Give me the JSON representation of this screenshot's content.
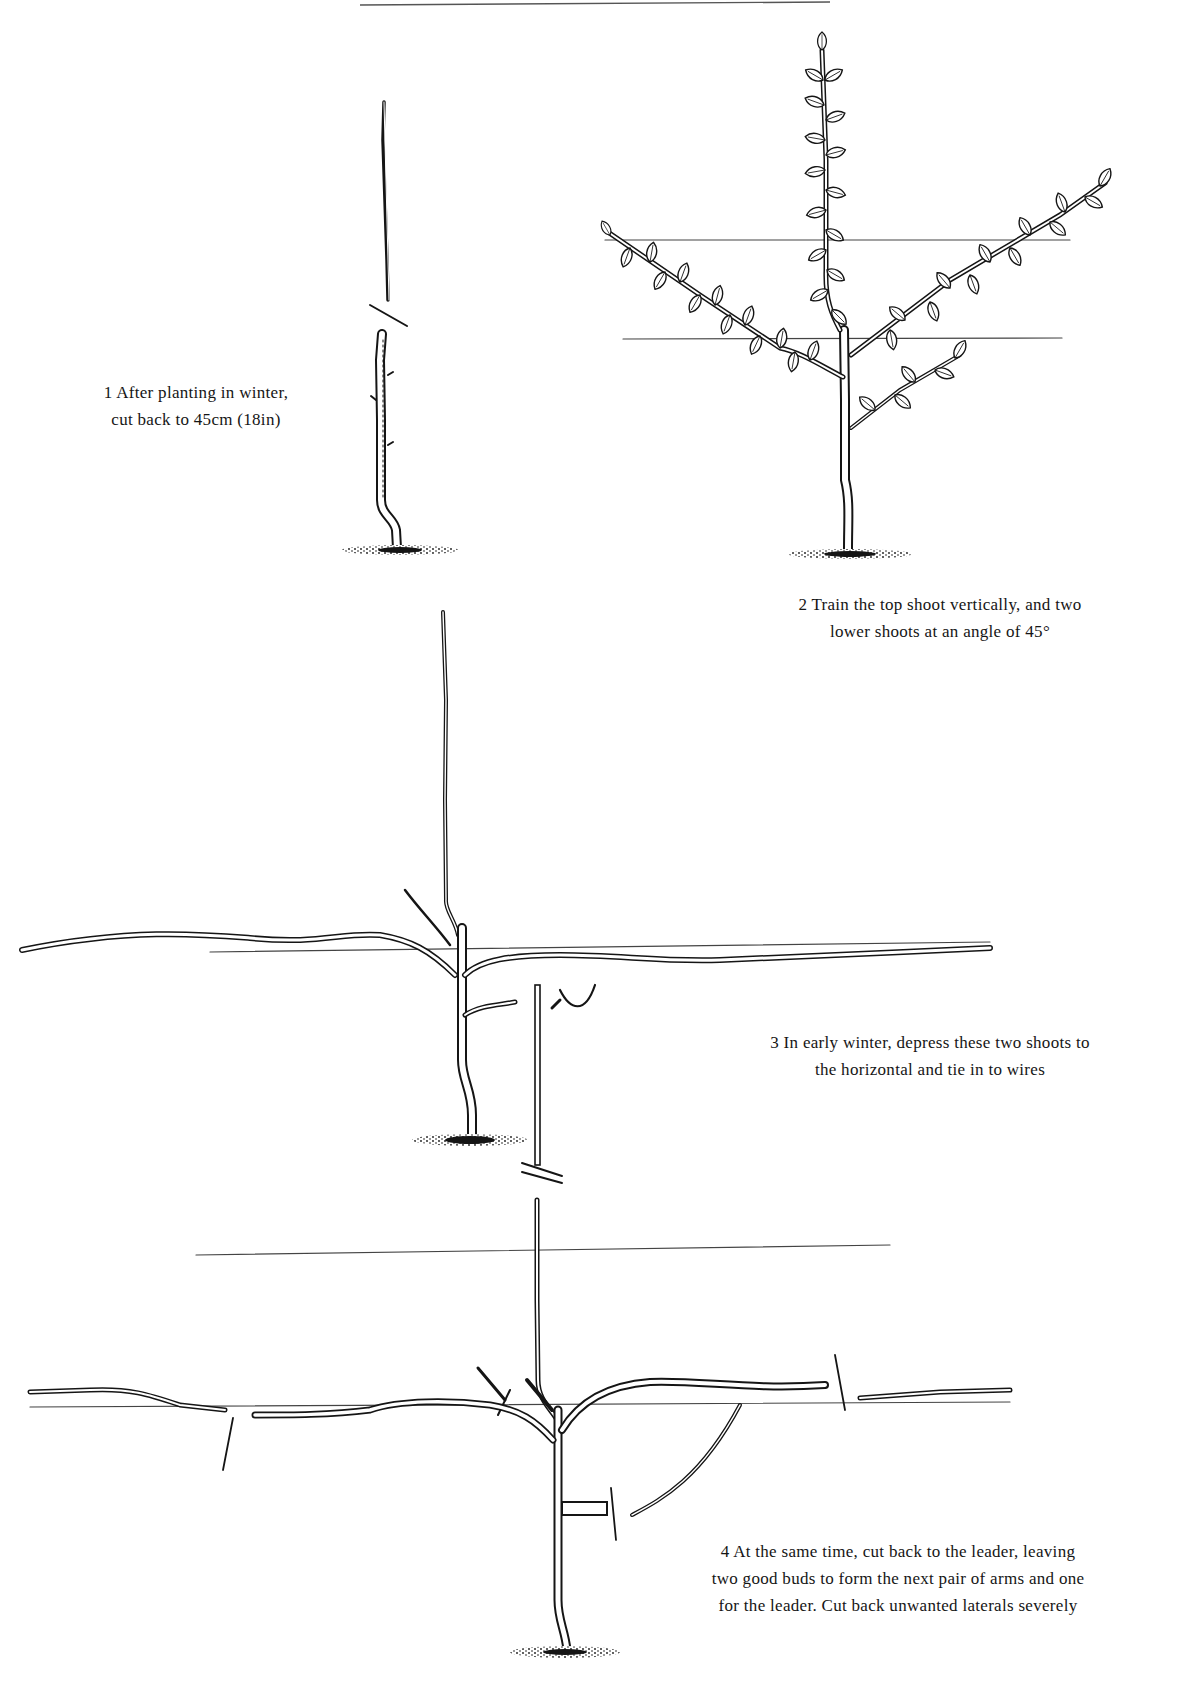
{
  "page": {
    "colors": {
      "ink": "#151515",
      "background": "#ffffff",
      "wire": "#444444"
    }
  },
  "steps": [
    {
      "number": "1",
      "caption_lines": [
        "1  After planting in winter,",
        "cut back to 45cm (18in)"
      ],
      "figure": "single-whip-cut-back"
    },
    {
      "number": "2",
      "caption_lines": [
        "2  Train the top shoot vertically, and two",
        "lower shoots at an angle of 45°"
      ],
      "figure": "leafy-tree-with-two-angled-shoots"
    },
    {
      "number": "3",
      "caption_lines": [
        "3  In early winter, depress these two shoots to",
        "the horizontal and tie in to wires"
      ],
      "figure": "shoots-lowered-to-horizontal-wire"
    },
    {
      "number": "4",
      "caption_lines": [
        "4  At the same time, cut back to the leader, leaving",
        "two good buds to form the next pair of arms and one",
        "for the leader. Cut back unwanted laterals severely"
      ],
      "figure": "leader-and-laterals-cut-back"
    }
  ]
}
